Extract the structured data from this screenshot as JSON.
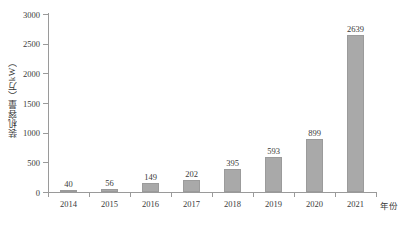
{
  "chart_data": {
    "type": "bar",
    "title": "",
    "subtitle": "",
    "xlabel": "年份",
    "ylabel": "装机容量（万kW）",
    "categories": [
      "2014",
      "2015",
      "2016",
      "2017",
      "2018",
      "2019",
      "2020",
      "2021"
    ],
    "values": [
      40,
      56,
      149,
      202,
      395,
      593,
      899,
      2639
    ],
    "data_labels": [
      "40",
      "56",
      "149",
      "202",
      "395",
      "593",
      "899",
      "2639"
    ],
    "ylim": [
      0,
      3000
    ],
    "y_ticks": [
      0,
      500,
      1000,
      1500,
      2000,
      2500,
      3000
    ],
    "y_tick_labels": [
      "0",
      "500",
      "1000",
      "1500",
      "2000",
      "2500",
      "3000"
    ],
    "grid": false,
    "legend": false,
    "legend_position": "none",
    "series": [
      {
        "name": "装机容量",
        "values": [
          40,
          56,
          149,
          202,
          395,
          593,
          899,
          2639
        ],
        "color": "#a9a9a9"
      }
    ],
    "colors": {
      "bar_fill": "#a9a9a9",
      "bar_border": "#9b9b9b",
      "axis": "#9a9a9a",
      "text": "#3a3a3a",
      "background": "#ffffff"
    }
  }
}
